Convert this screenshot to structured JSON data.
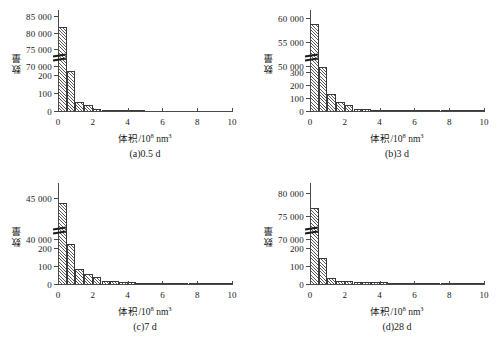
{
  "figure": {
    "axis_color": "#4a4a4a",
    "bar_edge_color": "#3a3a3a",
    "hatch_color": "#5a5a5a",
    "y_axis_label": "数量",
    "x_axis_label_prefix": "体积/10",
    "x_axis_label_exp": "8",
    "x_axis_label_unit": "nm",
    "x_axis_label_unit_exp": "3"
  },
  "chart_data": [
    {
      "type": "bar",
      "panel": "a",
      "title": "(a)0.5 d",
      "xlabel": "体积/10⁸ nm³",
      "ylabel": "数量",
      "grid": false,
      "legend": null,
      "broken_y_axis": true,
      "xlim": [
        0,
        10
      ],
      "xticks": [
        0,
        2,
        4,
        6,
        8,
        10
      ],
      "xtick_labels": [
        "0",
        "2",
        "4",
        "6",
        "8",
        "10"
      ],
      "y_lower_segment": {
        "lim": [
          0,
          250
        ],
        "ticks": [
          0,
          100,
          200
        ],
        "tick_labels": [
          "0",
          "100",
          "200"
        ]
      },
      "y_upper_segment": {
        "lim": [
          70000,
          86000
        ],
        "ticks": [
          70000,
          75000,
          80000,
          85000
        ],
        "tick_labels": [
          "70 000",
          "75 000",
          "80 000",
          "85 000"
        ]
      },
      "bin_width": 0.5,
      "bin_edges": [
        0,
        0.5,
        1.0,
        1.5,
        2.0,
        2.5,
        3.0,
        3.5,
        4.0,
        4.5,
        5.0,
        5.5,
        6.0,
        6.5,
        7.0,
        7.5,
        8.0,
        8.5,
        9.0,
        9.5,
        10.0
      ],
      "values": [
        82000,
        230,
        57,
        38,
        16,
        12,
        6,
        4,
        7,
        5,
        0,
        0,
        0,
        0,
        0,
        0,
        0,
        0,
        0,
        0
      ]
    },
    {
      "type": "bar",
      "panel": "b",
      "title": "(b)3 d",
      "xlabel": "体积/10⁸ nm³",
      "ylabel": "数量",
      "grid": false,
      "legend": null,
      "broken_y_axis": true,
      "xlim": [
        0,
        10
      ],
      "xticks": [
        0,
        2,
        4,
        6,
        8,
        10
      ],
      "xtick_labels": [
        "0",
        "2",
        "4",
        "6",
        "8",
        "10"
      ],
      "y_lower_segment": {
        "lim": [
          0,
          350
        ],
        "ticks": [
          0,
          100,
          200,
          300
        ],
        "tick_labels": [
          "0",
          "100",
          "200",
          "300"
        ]
      },
      "y_upper_segment": {
        "lim": [
          50000,
          61000
        ],
        "ticks": [
          50000,
          55000,
          60000
        ],
        "tick_labels": [
          "50 000",
          "55 000",
          "60 000"
        ]
      },
      "bin_width": 0.5,
      "bin_edges": [
        0,
        0.5,
        1.0,
        1.5,
        2.0,
        2.5,
        3.0,
        3.5,
        4.0,
        4.5,
        5.0,
        5.5,
        6.0,
        6.5,
        7.0,
        7.5,
        8.0,
        8.5,
        9.0,
        9.5,
        10.0
      ],
      "values": [
        59000,
        365,
        138,
        74,
        53,
        25,
        23,
        16,
        13,
        10,
        4,
        2,
        2,
        2,
        2,
        1,
        1,
        1,
        1,
        1
      ]
    },
    {
      "type": "bar",
      "panel": "c",
      "title": "(c)7 d",
      "xlabel": "体积/10⁸ nm³",
      "ylabel": "数量",
      "grid": false,
      "legend": null,
      "broken_y_axis": true,
      "xlim": [
        0,
        10
      ],
      "xticks": [
        0,
        2,
        4,
        6,
        8,
        10
      ],
      "xtick_labels": [
        "0",
        "2",
        "4",
        "6",
        "8",
        "10"
      ],
      "y_lower_segment": {
        "lim": [
          0,
          250
        ],
        "ticks": [
          0,
          100,
          200
        ],
        "tick_labels": [
          "0",
          "100",
          "200"
        ]
      },
      "y_upper_segment": {
        "lim": [
          40000,
          46500
        ],
        "ticks": [
          40000,
          45000
        ],
        "tick_labels": [
          "40 000",
          "45 000"
        ]
      },
      "bin_width": 0.5,
      "bin_edges": [
        0,
        0.5,
        1.0,
        1.5,
        2.0,
        2.5,
        3.0,
        3.5,
        4.0,
        4.5,
        5.0,
        5.5,
        6.0,
        6.5,
        7.0,
        7.5,
        8.0,
        8.5,
        9.0,
        9.5,
        10.0
      ],
      "values": [
        44500,
        225,
        88,
        62,
        45,
        24,
        22,
        14,
        15,
        10,
        9,
        6,
        9,
        5,
        3,
        3,
        2,
        2,
        2,
        3
      ]
    },
    {
      "type": "bar",
      "panel": "d",
      "title": "(d)28 d",
      "xlabel": "体积/10⁸ nm³",
      "ylabel": "数量",
      "grid": false,
      "legend": null,
      "broken_y_axis": true,
      "xlim": [
        0,
        10
      ],
      "xticks": [
        0,
        2,
        4,
        6,
        8,
        10
      ],
      "xtick_labels": [
        "0",
        "2",
        "4",
        "6",
        "8",
        "10"
      ],
      "y_lower_segment": {
        "lim": [
          0,
          250
        ],
        "ticks": [
          0,
          100,
          200
        ],
        "tick_labels": [
          "0",
          "100",
          "200"
        ]
      },
      "y_upper_segment": {
        "lim": [
          70000,
          81500
        ],
        "ticks": [
          70000,
          75000,
          80000
        ],
        "tick_labels": [
          "70 000",
          "75 000",
          "80 000"
        ]
      },
      "bin_width": 0.5,
      "bin_edges": [
        0,
        0.5,
        1.0,
        1.5,
        2.0,
        2.5,
        3.0,
        3.5,
        4.0,
        4.5,
        5.0,
        5.5,
        6.0,
        6.5,
        7.0,
        7.5,
        8.0,
        8.5,
        9.0,
        9.5,
        10.0
      ],
      "values": [
        77000,
        150,
        40,
        25,
        22,
        18,
        16,
        14,
        17,
        6,
        11,
        2,
        4,
        3,
        3,
        2,
        3,
        1,
        1,
        4
      ]
    }
  ]
}
